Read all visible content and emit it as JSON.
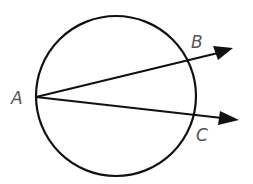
{
  "diagram": {
    "points": [
      {
        "id": "A",
        "label": "A",
        "role": "vertex on circle"
      },
      {
        "id": "B",
        "label": "B",
        "role": "intersection of upper ray with circle"
      },
      {
        "id": "C",
        "label": "C",
        "role": "intersection of lower ray with circle"
      }
    ],
    "rays": [
      {
        "from": "A",
        "through": "B"
      },
      {
        "from": "A",
        "through": "C"
      }
    ],
    "colors": {
      "stroke": "#111111",
      "label": "#555555",
      "background": "#ffffff"
    }
  }
}
